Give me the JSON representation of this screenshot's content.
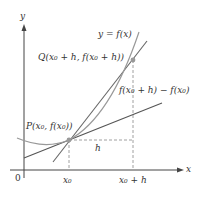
{
  "diagram": {
    "labels": {
      "y_axis": "y",
      "x_axis": "x",
      "origin": "0",
      "curve": "y = f(x)",
      "point_q": "Q(x₀ + h, f(x₀ + h))",
      "point_p": "P(x₀, f(x₀))",
      "rise": "f(x₀ + h) − f(x₀)",
      "run": "h",
      "x0_tick": "x₀",
      "x0h_tick": "x₀ + h"
    },
    "colors": {
      "axes": "#444444",
      "curve": "#999999",
      "secant": "#666666",
      "tangent": "#555555",
      "dashed": "#888888",
      "points": "#999999"
    },
    "elements": [
      "y-axis",
      "x-axis",
      "curve",
      "secant-line",
      "tangent-line",
      "point-P",
      "point-Q",
      "dashed-run",
      "dashed-rise",
      "dashed-x0"
    ]
  }
}
